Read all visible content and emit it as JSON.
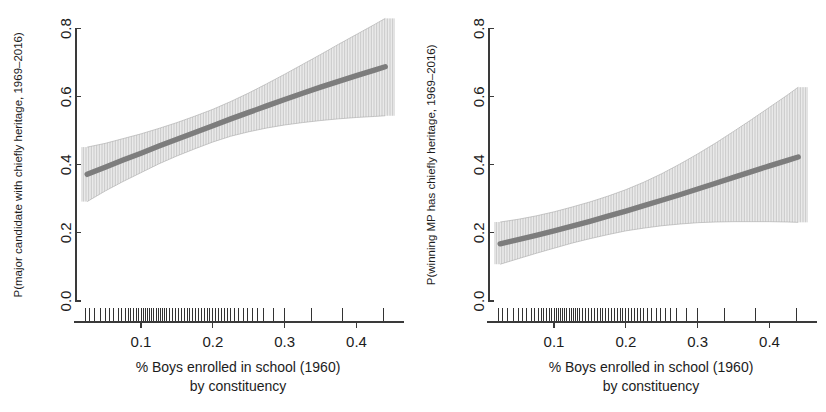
{
  "figure": {
    "background_color": "#ffffff",
    "line_color": "#7d7d7d",
    "band_color": "#9a9a9a",
    "axis_color": "#3a3a3a",
    "rug_color": "#1d1d1d"
  },
  "panels": [
    {
      "id": "left",
      "name": "major-candidate-panel",
      "ylabel": "P(major candidate with chiefly heritage, 1969–2016)",
      "xlabel_line1": "% Boys enrolled in school (1960)",
      "xlabel_line2": "by constituency",
      "yticks": [
        "0.0",
        "0.2",
        "0.4",
        "0.6",
        "0.8"
      ],
      "xticks": [
        "0.1",
        "0.2",
        "0.3",
        "0.4"
      ]
    },
    {
      "id": "right",
      "name": "winning-mp-panel",
      "ylabel": "P(winning MP has chiefly heritage, 1969–2016)",
      "xlabel_line1": "% Boys enrolled in school (1960)",
      "xlabel_line2": "by constituency",
      "yticks": [
        "0.0",
        "0.2",
        "0.4",
        "0.6",
        "0.8"
      ],
      "xticks": [
        "0.1",
        "0.2",
        "0.3",
        "0.4"
      ]
    }
  ],
  "chart_data": [
    {
      "type": "line",
      "id": "left",
      "title": "",
      "xlabel": "% Boys enrolled in school (1960) by constituency",
      "ylabel": "P(major candidate with chiefly heritage, 1969–2016)",
      "xlim": [
        0.015,
        0.455
      ],
      "ylim": [
        0.0,
        0.84
      ],
      "xticks": [
        0.1,
        0.2,
        0.3,
        0.4
      ],
      "yticks": [
        0.0,
        0.2,
        0.4,
        0.6,
        0.8
      ],
      "grid": false,
      "legend": "none",
      "series": [
        {
          "name": "fitted",
          "x": [
            0.025,
            0.05,
            0.075,
            0.1,
            0.125,
            0.15,
            0.175,
            0.2,
            0.225,
            0.25,
            0.275,
            0.3,
            0.325,
            0.35,
            0.375,
            0.4,
            0.425,
            0.44
          ],
          "values": [
            0.372,
            0.393,
            0.414,
            0.434,
            0.455,
            0.475,
            0.495,
            0.515,
            0.535,
            0.554,
            0.573,
            0.592,
            0.61,
            0.628,
            0.645,
            0.662,
            0.678,
            0.688
          ]
        },
        {
          "name": "ci_upper",
          "x": [
            0.025,
            0.05,
            0.075,
            0.1,
            0.125,
            0.15,
            0.175,
            0.2,
            0.225,
            0.25,
            0.275,
            0.3,
            0.325,
            0.35,
            0.375,
            0.4,
            0.425,
            0.44
          ],
          "values": [
            0.452,
            0.463,
            0.477,
            0.491,
            0.507,
            0.524,
            0.543,
            0.563,
            0.586,
            0.611,
            0.638,
            0.666,
            0.695,
            0.724,
            0.754,
            0.783,
            0.812,
            0.83
          ]
        },
        {
          "name": "ci_lower",
          "x": [
            0.025,
            0.05,
            0.075,
            0.1,
            0.125,
            0.15,
            0.175,
            0.2,
            0.225,
            0.25,
            0.275,
            0.3,
            0.325,
            0.35,
            0.375,
            0.4,
            0.425,
            0.44
          ],
          "values": [
            0.292,
            0.323,
            0.351,
            0.377,
            0.403,
            0.426,
            0.447,
            0.467,
            0.484,
            0.497,
            0.508,
            0.517,
            0.524,
            0.53,
            0.535,
            0.539,
            0.542,
            0.544
          ]
        }
      ],
      "rug_x": [
        0.022,
        0.028,
        0.035,
        0.043,
        0.05,
        0.056,
        0.062,
        0.068,
        0.073,
        0.078,
        0.082,
        0.086,
        0.09,
        0.094,
        0.097,
        0.1,
        0.103,
        0.106,
        0.109,
        0.112,
        0.115,
        0.118,
        0.121,
        0.124,
        0.127,
        0.13,
        0.133,
        0.136,
        0.14,
        0.144,
        0.148,
        0.152,
        0.156,
        0.16,
        0.164,
        0.168,
        0.172,
        0.176,
        0.18,
        0.184,
        0.188,
        0.192,
        0.196,
        0.2,
        0.204,
        0.208,
        0.212,
        0.216,
        0.22,
        0.225,
        0.23,
        0.236,
        0.242,
        0.248,
        0.255,
        0.262,
        0.27,
        0.285,
        0.3,
        0.337,
        0.38,
        0.437
      ]
    },
    {
      "type": "line",
      "id": "right",
      "title": "",
      "xlabel": "% Boys enrolled in school (1960) by constituency",
      "ylabel": "P(winning MP has chiefly heritage, 1969–2016)",
      "xlim": [
        0.015,
        0.455
      ],
      "ylim": [
        0.0,
        0.84
      ],
      "xticks": [
        0.1,
        0.2,
        0.3,
        0.4
      ],
      "yticks": [
        0.0,
        0.2,
        0.4,
        0.6,
        0.8
      ],
      "grid": false,
      "legend": "none",
      "series": [
        {
          "name": "fitted",
          "x": [
            0.025,
            0.05,
            0.075,
            0.1,
            0.125,
            0.15,
            0.175,
            0.2,
            0.225,
            0.25,
            0.275,
            0.3,
            0.325,
            0.35,
            0.375,
            0.4,
            0.425,
            0.44
          ],
          "values": [
            0.168,
            0.18,
            0.193,
            0.206,
            0.22,
            0.234,
            0.249,
            0.264,
            0.28,
            0.296,
            0.312,
            0.329,
            0.346,
            0.363,
            0.38,
            0.397,
            0.413,
            0.423
          ]
        },
        {
          "name": "ci_upper",
          "x": [
            0.025,
            0.05,
            0.075,
            0.1,
            0.125,
            0.15,
            0.175,
            0.2,
            0.225,
            0.25,
            0.275,
            0.3,
            0.325,
            0.35,
            0.375,
            0.4,
            0.425,
            0.44
          ],
          "values": [
            0.232,
            0.24,
            0.25,
            0.262,
            0.276,
            0.291,
            0.308,
            0.327,
            0.349,
            0.374,
            0.402,
            0.432,
            0.464,
            0.498,
            0.533,
            0.569,
            0.605,
            0.628
          ]
        },
        {
          "name": "ci_lower",
          "x": [
            0.025,
            0.05,
            0.075,
            0.1,
            0.125,
            0.15,
            0.175,
            0.2,
            0.225,
            0.25,
            0.275,
            0.3,
            0.325,
            0.35,
            0.375,
            0.4,
            0.425,
            0.44
          ],
          "values": [
            0.108,
            0.124,
            0.14,
            0.155,
            0.17,
            0.183,
            0.195,
            0.206,
            0.214,
            0.221,
            0.226,
            0.23,
            0.232,
            0.233,
            0.233,
            0.233,
            0.232,
            0.231
          ]
        }
      ],
      "rug_x": [
        0.022,
        0.028,
        0.035,
        0.043,
        0.05,
        0.056,
        0.062,
        0.068,
        0.073,
        0.078,
        0.082,
        0.086,
        0.09,
        0.094,
        0.097,
        0.1,
        0.103,
        0.106,
        0.109,
        0.112,
        0.115,
        0.118,
        0.121,
        0.124,
        0.127,
        0.13,
        0.133,
        0.136,
        0.14,
        0.144,
        0.148,
        0.152,
        0.156,
        0.16,
        0.164,
        0.168,
        0.172,
        0.176,
        0.18,
        0.184,
        0.188,
        0.192,
        0.196,
        0.2,
        0.204,
        0.208,
        0.212,
        0.216,
        0.22,
        0.225,
        0.23,
        0.236,
        0.242,
        0.248,
        0.255,
        0.262,
        0.27,
        0.285,
        0.3,
        0.337,
        0.38,
        0.437
      ]
    }
  ]
}
